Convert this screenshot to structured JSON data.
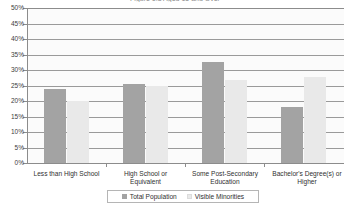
{
  "chart_data": {
    "type": "bar",
    "title": "Figure 1.3  Aged 15 and Over",
    "xlabel": "",
    "ylabel": "",
    "ylim": [
      0,
      50
    ],
    "ytick_step": 5,
    "ytick_labels": [
      "0%",
      "5%",
      "10%",
      "15%",
      "20%",
      "25%",
      "30%",
      "35%",
      "40%",
      "45%",
      "50%"
    ],
    "grid": true,
    "legend_position": "bottom",
    "categories": [
      "Less than High School",
      "High School or Equivalent",
      "Some Post-Secondary Education",
      "Bachelor's Degree(s) or Higher"
    ],
    "series": [
      {
        "name": "Total Population",
        "color": "#a3a3a3",
        "values": [
          23.9,
          25.4,
          32.6,
          18.0
        ]
      },
      {
        "name": "Visible Minorities",
        "color": "#e9e9e9",
        "values": [
          20.0,
          25.0,
          26.8,
          27.7
        ]
      }
    ]
  },
  "axis": {
    "y_labels": [
      "50%",
      "45%",
      "40%",
      "35%",
      "30%",
      "25%",
      "20%",
      "15%",
      "10%",
      "5%",
      "0%"
    ],
    "x_labels": [
      {
        "line1": "Less than High School",
        "line2": ""
      },
      {
        "line1": "High School or",
        "line2": "Equivalent"
      },
      {
        "line1": "Some Post-Secondary",
        "line2": "Education"
      },
      {
        "line1": "Bachelor's Degree(s) or",
        "line2": "Higher"
      }
    ]
  },
  "legend": {
    "items": [
      {
        "label": "Total Population"
      },
      {
        "label": "Visible Minorities"
      }
    ]
  }
}
